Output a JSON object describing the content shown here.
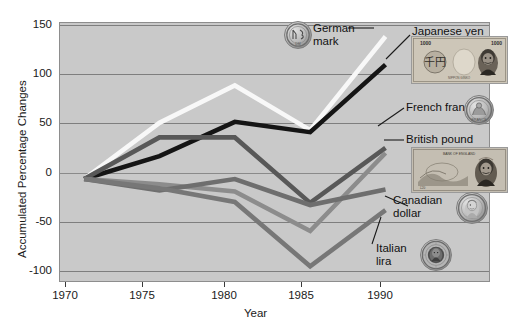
{
  "chart_data": {
    "type": "line",
    "title": "",
    "xlabel": "Year",
    "ylabel": "Accumulated Percentage Changes",
    "x": [
      1970,
      1975,
      1980,
      1985,
      1990
    ],
    "xticklabels": [
      "1970",
      "1975",
      "1980",
      "1985",
      "1990"
    ],
    "yticklabels": [
      "150",
      "100",
      "50",
      "0",
      "-50",
      "-100"
    ],
    "yticks": [
      150,
      100,
      50,
      0,
      -50,
      -100
    ],
    "ylim": [
      -100,
      150
    ],
    "xlim": [
      1968.4,
      1997.0
    ],
    "grid": true,
    "legend": "callout-labels-right",
    "series": [
      {
        "name": "German mark",
        "values": [
          0,
          54,
          90,
          47,
          137
        ],
        "color": "#f8f8f8"
      },
      {
        "name": "Japanese yen",
        "values": [
          0,
          22,
          55,
          45,
          110
        ],
        "color": "#151515"
      },
      {
        "name": "French franc",
        "values": [
          0,
          40,
          40,
          -23,
          30
        ],
        "color": "#585858"
      },
      {
        "name": "British pound",
        "values": [
          0,
          -5,
          -12,
          -50,
          25
        ],
        "color": "#8c8c8c"
      },
      {
        "name": "Canadian dollar",
        "values": [
          0,
          -11,
          0,
          -25,
          -10
        ],
        "color": "#6e6e6e"
      },
      {
        "name": "Italian lira",
        "values": [
          0,
          -9,
          -22,
          -84,
          -30
        ],
        "color": "#777777"
      }
    ]
  },
  "annotations": [
    {
      "label": "German\nmark",
      "icon": "german-mark-coin"
    },
    {
      "label": "Japanese yen",
      "icon": "japanese-yen-note"
    },
    {
      "label": "French franc",
      "icon": "french-franc-coin"
    },
    {
      "label": "British pound",
      "icon": "british-pound-note"
    },
    {
      "label": "Canadian\ndollar",
      "icon": "canadian-dollar-coin"
    },
    {
      "label": "Italian\nlira",
      "icon": "italian-lira-coin"
    }
  ],
  "colors": {
    "plot_background": "#c9c9c9",
    "gridline": "#7e7e7e",
    "axis_text": "#1a1a1a",
    "page_background": "#ffffff"
  }
}
